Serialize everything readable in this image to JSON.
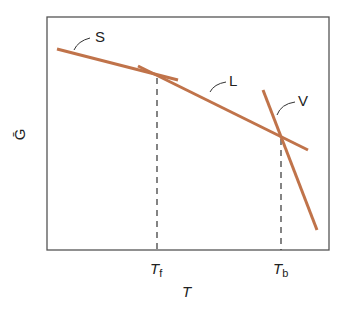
{
  "diagram": {
    "type": "phase-stability",
    "ylabel": "Ḡ",
    "xlabel": "T",
    "curves": [
      {
        "label": "S",
        "color": "#c0734a"
      },
      {
        "label": "L",
        "color": "#c0734a"
      },
      {
        "label": "V",
        "color": "#c0734a"
      }
    ],
    "ticks": [
      {
        "main": "T",
        "sub": "f"
      },
      {
        "main": "T",
        "sub": "b"
      }
    ]
  }
}
